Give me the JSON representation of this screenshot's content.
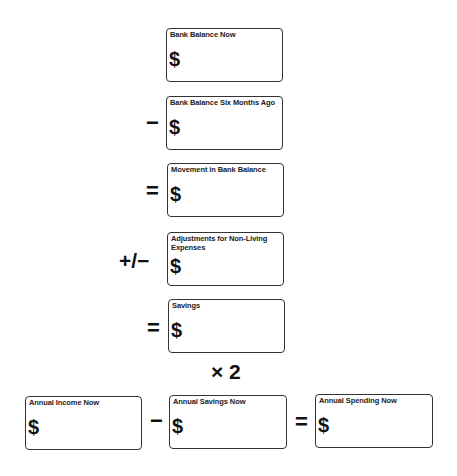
{
  "currency_symbol": "$",
  "boxes": [
    {
      "id": "bank-balance-now",
      "label": "Bank Balance Now",
      "value": ""
    },
    {
      "id": "bank-balance-six-months-ago",
      "label": "Bank Balance Six Months Ago",
      "value": ""
    },
    {
      "id": "movement-in-bank-balance",
      "label": "Movement in Bank Balance",
      "value": ""
    },
    {
      "id": "adjustments-non-living-expenses",
      "label": "Adjustments for Non-Living Expenses",
      "value": ""
    },
    {
      "id": "savings",
      "label": "Savings",
      "value": ""
    },
    {
      "id": "annual-income-now",
      "label": "Annual Income Now",
      "value": ""
    },
    {
      "id": "annual-savings-now",
      "label": "Annual Savings Now",
      "value": ""
    },
    {
      "id": "annual-spending-now",
      "label": "Annual Spending Now",
      "value": ""
    }
  ],
  "operators": {
    "minus_1": "−",
    "equals_1": "=",
    "plus_minus": "+/−",
    "equals_2": "=",
    "times_two": "× 2",
    "minus_2": "−",
    "equals_3": "="
  }
}
